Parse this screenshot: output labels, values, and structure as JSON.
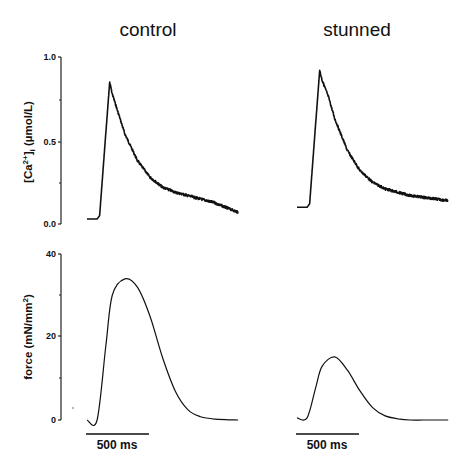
{
  "panels": {
    "left_title": "control",
    "right_title": "stunned"
  },
  "axes": {
    "calcium": {
      "label_main": "[Ca",
      "label_sup": "2+",
      "label_close": "]",
      "label_sub": "i",
      "label_unit": " (µmol/L)",
      "ticks": [
        "1.0",
        "0.5",
        "0.0"
      ]
    },
    "force": {
      "label_main": "force (mN/mm",
      "label_sup": "2",
      "label_close": ")",
      "ticks": [
        "40",
        "20",
        "0"
      ]
    }
  },
  "scale_bars": {
    "control": "500 ms",
    "stunned": "500 ms"
  },
  "chart_data": [
    {
      "type": "line",
      "title": "control",
      "ylabel": "[Ca2+]i (µmol/L)",
      "ylim": [
        0,
        1.0
      ],
      "yticks": [
        0.0,
        0.5,
        1.0
      ],
      "x_scale_bar_ms": 500,
      "series": [
        {
          "name": "calcium transient",
          "x_ms": [
            0,
            80,
            100,
            180,
            200,
            250,
            300,
            400,
            500,
            600,
            700,
            800,
            900,
            1000,
            1100,
            1200
          ],
          "values": [
            0.03,
            0.03,
            0.05,
            0.85,
            0.78,
            0.66,
            0.54,
            0.38,
            0.28,
            0.22,
            0.19,
            0.17,
            0.15,
            0.13,
            0.1,
            0.07
          ]
        }
      ]
    },
    {
      "type": "line",
      "title": "stunned",
      "ylabel": "[Ca2+]i (µmol/L)",
      "ylim": [
        0,
        1.0
      ],
      "yticks": [
        0.0,
        0.5,
        1.0
      ],
      "x_scale_bar_ms": 500,
      "series": [
        {
          "name": "calcium transient",
          "x_ms": [
            0,
            80,
            100,
            180,
            200,
            250,
            300,
            400,
            500,
            600,
            700,
            800,
            900,
            1000,
            1100,
            1200
          ],
          "values": [
            0.1,
            0.1,
            0.12,
            0.92,
            0.86,
            0.76,
            0.63,
            0.44,
            0.32,
            0.25,
            0.21,
            0.19,
            0.17,
            0.16,
            0.15,
            0.14
          ]
        }
      ]
    },
    {
      "type": "line",
      "title": "control",
      "ylabel": "force (mN/mm2)",
      "ylim": [
        0,
        40
      ],
      "yticks": [
        0,
        20,
        40
      ],
      "x_scale_bar_ms": 500,
      "series": [
        {
          "name": "force",
          "x_ms": [
            0,
            80,
            150,
            200,
            300,
            400,
            500,
            600,
            700,
            800,
            900,
            1000,
            1100,
            1200
          ],
          "values": [
            0,
            0,
            18,
            30,
            34,
            32,
            25,
            15,
            7,
            2.5,
            0.8,
            0.3,
            0.1,
            0
          ]
        }
      ]
    },
    {
      "type": "line",
      "title": "stunned",
      "ylabel": "force (mN/mm2)",
      "ylim": [
        0,
        40
      ],
      "yticks": [
        0,
        20,
        40
      ],
      "x_scale_bar_ms": 500,
      "series": [
        {
          "name": "force",
          "x_ms": [
            0,
            80,
            150,
            200,
            300,
            400,
            500,
            600,
            700,
            800,
            900,
            1000,
            1100,
            1200
          ],
          "values": [
            0.5,
            0.5,
            8,
            13,
            15.2,
            12,
            7,
            3,
            1,
            0.3,
            0,
            0,
            0,
            0
          ]
        }
      ]
    }
  ]
}
